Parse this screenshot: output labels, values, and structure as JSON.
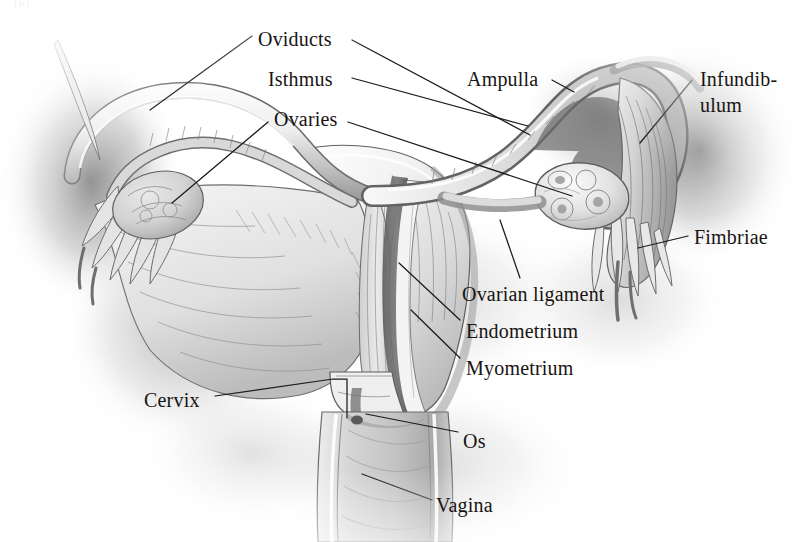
{
  "figure": {
    "caption_fragment": "(b)",
    "background_color": "#ffffff",
    "ink_color": "#181411",
    "leader_color": "#1d1a17",
    "style": "grayscale pencil/airbrush medical illustration"
  },
  "labels": [
    {
      "id": "oviducts",
      "text": "Oviducts",
      "x": 258,
      "y": 28,
      "lines": 1
    },
    {
      "id": "isthmus",
      "text": "Isthmus",
      "x": 268,
      "y": 68,
      "lines": 1
    },
    {
      "id": "ampulla",
      "text": "Ampulla",
      "x": 467,
      "y": 68,
      "lines": 1
    },
    {
      "id": "infundibulum",
      "text": "Infundib-\nulum",
      "x": 700,
      "y": 66,
      "lines": 2
    },
    {
      "id": "ovaries",
      "text": "Ovaries",
      "x": 274,
      "y": 108,
      "lines": 1
    },
    {
      "id": "fimbriae",
      "text": "Fimbriae",
      "x": 694,
      "y": 226,
      "lines": 1
    },
    {
      "id": "ovarian-ligament",
      "text": "Ovarian ligament",
      "x": 462,
      "y": 283,
      "lines": 1
    },
    {
      "id": "endometrium",
      "text": "Endometrium",
      "x": 466,
      "y": 320,
      "lines": 1
    },
    {
      "id": "myometrium",
      "text": "Myometrium",
      "x": 466,
      "y": 357,
      "lines": 1
    },
    {
      "id": "cervix",
      "text": "Cervix",
      "x": 144,
      "y": 389,
      "lines": 1
    },
    {
      "id": "os",
      "text": "Os",
      "x": 463,
      "y": 430,
      "lines": 1
    },
    {
      "id": "vagina",
      "text": "Vagina",
      "x": 436,
      "y": 494,
      "lines": 1
    }
  ],
  "structures": [
    {
      "id": "left-oviduct",
      "name": "Left oviduct (fallopian tube)"
    },
    {
      "id": "right-oviduct",
      "name": "Right oviduct (fallopian tube)"
    },
    {
      "id": "left-ovary",
      "name": "Left ovary"
    },
    {
      "id": "right-ovary",
      "name": "Right ovary with follicles"
    },
    {
      "id": "left-fimbriae",
      "name": "Left fimbriae"
    },
    {
      "id": "right-fimbriae",
      "name": "Right fimbriae"
    },
    {
      "id": "infundibulum-funnel",
      "name": "Infundibulum funnel"
    },
    {
      "id": "uterus-body",
      "name": "Uterus body"
    },
    {
      "id": "uterine-cavity",
      "name": "Uterine cavity"
    },
    {
      "id": "endometrium-layer",
      "name": "Endometrium lining"
    },
    {
      "id": "myometrium-layer",
      "name": "Myometrium muscle wall"
    },
    {
      "id": "ovarian-ligament-band",
      "name": "Ovarian ligament"
    },
    {
      "id": "cervix-structure",
      "name": "Cervix"
    },
    {
      "id": "os-opening",
      "name": "Cervical os"
    },
    {
      "id": "vagina-canal",
      "name": "Vaginal canal"
    },
    {
      "id": "broad-ligament",
      "name": "Broad ligament sheet"
    }
  ]
}
